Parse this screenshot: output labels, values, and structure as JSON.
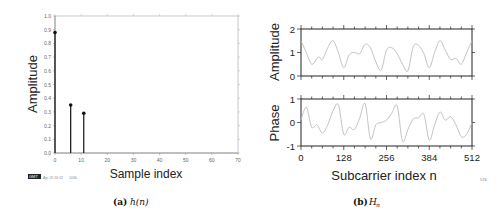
{
  "chart_data": [
    {
      "type": "stem",
      "panel": "a",
      "caption_label": "(a)",
      "caption_math": "h(n)",
      "title": "",
      "xlabel": "Sample index",
      "ylabel": "Amplitude",
      "xlim": [
        0,
        70
      ],
      "ylim": [
        0,
        1.0
      ],
      "xticks": [
        "0",
        "10",
        "20",
        "30",
        "40",
        "50",
        "60",
        "70"
      ],
      "yticks": [
        "0.0",
        "0.1",
        "0.2",
        "0.3",
        "0.4",
        "0.5",
        "0.6",
        "0.7",
        "0.8",
        "0.9",
        "1.0"
      ],
      "grid": false,
      "x": [
        0,
        6,
        11
      ],
      "values": [
        0.88,
        0.35,
        0.29
      ],
      "footer_stamp": "GMT",
      "footer_date": "Apr 20 20:12",
      "footer_extra": "1006"
    },
    {
      "type": "line",
      "panel": "b",
      "caption_label": "(b)",
      "caption_math": "H",
      "caption_sub": "n",
      "xlabel": "Subcarrier index n",
      "xlim": [
        0,
        512
      ],
      "xticks": [
        "0",
        "128",
        "256",
        "384",
        "512"
      ],
      "corner_label": "576",
      "grid": false,
      "subplots": [
        {
          "ylabel": "Amplitude",
          "ylim": [
            0,
            2
          ],
          "yticks": [
            "0",
            "1",
            "2"
          ],
          "x": [
            0,
            16,
            32,
            48,
            56,
            64,
            80,
            96,
            112,
            128,
            144,
            160,
            176,
            192,
            208,
            224,
            240,
            256,
            272,
            288,
            304,
            320,
            336,
            352,
            368,
            384,
            400,
            416,
            432,
            448,
            464,
            480,
            496,
            512
          ],
          "values": [
            1.5,
            1.0,
            0.5,
            0.75,
            0.8,
            0.7,
            1.2,
            1.5,
            1.0,
            0.35,
            0.9,
            1.0,
            0.95,
            1.35,
            1.2,
            0.6,
            0.25,
            1.1,
            1.2,
            0.95,
            0.5,
            0.22,
            1.25,
            1.3,
            0.95,
            0.35,
            1.0,
            1.5,
            1.1,
            0.7,
            0.75,
            0.5,
            1.0,
            1.5
          ]
        },
        {
          "ylabel": "Phase",
          "ylim": [
            -1,
            1
          ],
          "yticks": [
            "-1",
            "0",
            "1"
          ],
          "x": [
            0,
            16,
            32,
            48,
            64,
            80,
            96,
            112,
            128,
            144,
            160,
            176,
            192,
            208,
            224,
            240,
            256,
            272,
            288,
            304,
            320,
            336,
            352,
            368,
            384,
            400,
            416,
            432,
            448,
            464,
            480,
            496,
            512
          ],
          "values": [
            0.1,
            0.65,
            -0.2,
            -0.1,
            -0.45,
            -0.1,
            0.5,
            0.75,
            -0.5,
            -0.2,
            -0.3,
            0.2,
            0.8,
            -0.7,
            -0.1,
            0.0,
            0.1,
            0.4,
            0.7,
            -0.8,
            -0.3,
            0.15,
            0.2,
            0.35,
            -0.75,
            -0.1,
            0.45,
            0.1,
            0.25,
            -0.1,
            -0.6,
            -0.5,
            0.0
          ]
        }
      ]
    }
  ]
}
